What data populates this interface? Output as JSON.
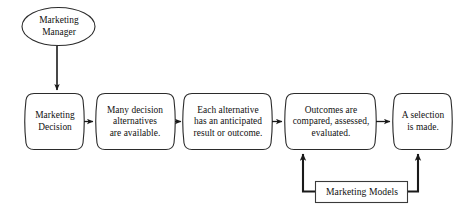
{
  "diagram": {
    "type": "flowchart",
    "background_color": "#ffffff",
    "line_color": "#1a1a1a",
    "shape_fill": "#ffffff",
    "shape_stroke": "#2b2b2b",
    "nodes": [
      {
        "id": "marketing-manager",
        "shape": "ellipse",
        "label": "Marketing\nManager"
      },
      {
        "id": "marketing-decision",
        "shape": "barrel",
        "label": "Marketing\nDecision"
      },
      {
        "id": "many-alternatives",
        "shape": "barrel",
        "label": "Many decision\nalternatives\nare available."
      },
      {
        "id": "anticipated-outcome",
        "shape": "barrel",
        "label": "Each alternative\nhas an anticipated\nresult or outcome."
      },
      {
        "id": "outcomes-evaluated",
        "shape": "barrel",
        "label": "Outcomes are\ncompared, assessed,\nevaluated."
      },
      {
        "id": "selection-made",
        "shape": "barrel",
        "label": "A selection\nis made."
      },
      {
        "id": "marketing-models",
        "shape": "rectangle",
        "label": "Marketing Models"
      }
    ],
    "connectors": [
      {
        "id": "manager-to-decision",
        "from": "marketing-manager",
        "to": "marketing-decision",
        "direction": "down",
        "arrow": "single"
      },
      {
        "id": "decision-to-alternatives",
        "from": "marketing-decision",
        "to": "many-alternatives",
        "direction": "right",
        "arrow": "single"
      },
      {
        "id": "alternatives-to-anticipated",
        "from": "many-alternatives",
        "to": "anticipated-outcome",
        "direction": "right",
        "arrow": "single"
      },
      {
        "id": "anticipated-to-outcomes",
        "from": "anticipated-outcome",
        "to": "outcomes-evaluated",
        "direction": "right",
        "arrow": "single"
      },
      {
        "id": "outcomes-to-selection",
        "from": "outcomes-evaluated",
        "to": "selection-made",
        "direction": "right",
        "arrow": "single"
      },
      {
        "id": "models-to-outcomes",
        "from": "marketing-models",
        "to": "outcomes-evaluated",
        "direction": "up",
        "arrow": "single"
      },
      {
        "id": "models-to-selection",
        "from": "marketing-models",
        "to": "selection-made",
        "direction": "up",
        "arrow": "single"
      }
    ]
  }
}
